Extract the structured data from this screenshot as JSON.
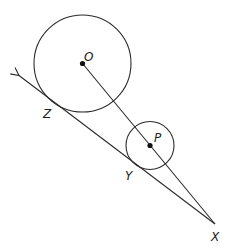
{
  "diagram": {
    "colors": {
      "stroke": "#2b2b2b",
      "background": "#ffffff"
    },
    "points": {
      "O": {
        "label": "O",
        "x": 82.5,
        "y": 63.5
      },
      "P": {
        "label": "P",
        "x": 150,
        "y": 145.5
      },
      "X": {
        "label": "X",
        "x": 215,
        "y": 224
      },
      "Y": {
        "label": "Y",
        "x": 139,
        "y": 168
      },
      "Z": {
        "label": "Z",
        "x": 52,
        "y": 103
      }
    },
    "circles": [
      {
        "center": "O",
        "r": 48.5
      },
      {
        "center": "P",
        "r": 24
      }
    ],
    "labels": {
      "O": "O",
      "P": "P",
      "X": "X",
      "Y": "Y",
      "Z": "Z"
    }
  }
}
